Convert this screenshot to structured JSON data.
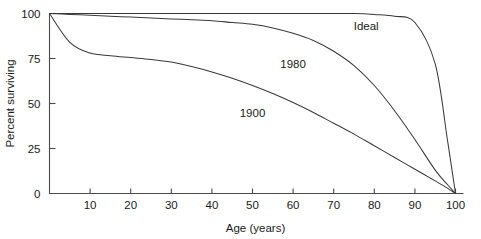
{
  "chart_data": {
    "type": "line",
    "title": "",
    "xlabel": "Age (years)",
    "ylabel": "Percent surviving",
    "xlim": [
      0,
      100
    ],
    "ylim": [
      0,
      100
    ],
    "xticks": [
      0,
      10,
      20,
      30,
      40,
      50,
      60,
      70,
      80,
      90,
      100
    ],
    "xticklabels": [
      "",
      "10",
      "20",
      "30",
      "40",
      "50",
      "60",
      "70",
      "80",
      "90",
      "100"
    ],
    "yticks": [
      0,
      25,
      50,
      75,
      100
    ],
    "yticklabels": [
      "0",
      "25",
      "50",
      "75",
      "100"
    ],
    "grid": false,
    "legend": "inline-curve-labels",
    "line_color": "#3a3a3a",
    "background_color": "#ffffff",
    "x": [
      0,
      5,
      10,
      15,
      20,
      25,
      30,
      35,
      40,
      45,
      50,
      55,
      60,
      65,
      70,
      75,
      80,
      85,
      90,
      95,
      98,
      100
    ],
    "series": [
      {
        "name": "Ideal",
        "label": "Ideal",
        "label_x": 78,
        "label_y": 93,
        "values": [
          100,
          100,
          100,
          100,
          100,
          100,
          100,
          100,
          100,
          100,
          100,
          100,
          100,
          100,
          100,
          100,
          99.5,
          98.5,
          95,
          72,
          30,
          0
        ]
      },
      {
        "name": "1980",
        "label": "1980",
        "label_x": 60,
        "label_y": 72,
        "values": [
          100,
          99.5,
          99,
          98.5,
          98,
          97.5,
          97,
          96.5,
          96,
          95,
          94,
          92,
          89,
          85,
          79,
          71,
          60,
          46,
          30,
          13,
          5,
          0
        ]
      },
      {
        "name": "1900",
        "label": "1900",
        "label_x": 50,
        "label_y": 45,
        "values": [
          100,
          84,
          78,
          76.5,
          75.5,
          74.5,
          73,
          70.5,
          67.5,
          64,
          60,
          55.5,
          50.5,
          45,
          39,
          33,
          26.5,
          20,
          13.5,
          7,
          3,
          0
        ]
      }
    ],
    "annotations": [
      {
        "text": "Ideal",
        "series": "Ideal"
      },
      {
        "text": "1980",
        "series": "1980"
      },
      {
        "text": "1900",
        "series": "1900"
      }
    ]
  }
}
